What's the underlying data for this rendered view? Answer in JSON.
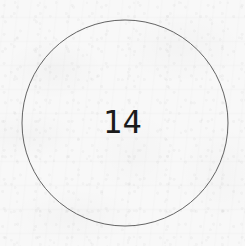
{
  "document": {
    "kind": "scanned-paper-figure",
    "background_color": "#f8f8f8",
    "width": 245,
    "height": 246
  },
  "figure": {
    "name": "numbered-circle",
    "shape": "circle",
    "label": "14",
    "stroke_color": "#565656",
    "stroke_width": 1,
    "fill": "none",
    "center_x": 125,
    "center_y": 123,
    "radius": 103,
    "label_color": "#1b1b1b",
    "label_font_size": 32
  },
  "texture": {
    "grain_description": "paper-grain",
    "mottle_description": "paper-mottle",
    "bleed_description": "reverse-side-bleed-through"
  }
}
